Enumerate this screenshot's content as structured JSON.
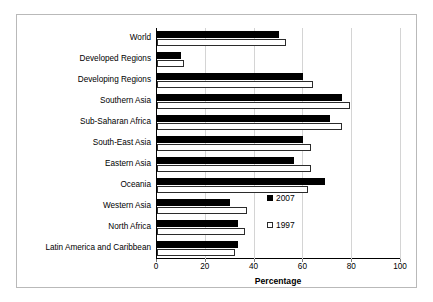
{
  "chart_data": {
    "type": "bar",
    "orientation": "horizontal",
    "title": "",
    "xlabel": "Percentage",
    "ylabel": "",
    "xlim": [
      0,
      100
    ],
    "xticks": [
      0,
      20,
      40,
      60,
      80,
      100
    ],
    "grid": "vertical",
    "legend_position": "inside-right",
    "categories": [
      "World",
      "Developed Regions",
      "Developing Regions",
      "Southern Asia",
      "Sub-Saharan Africa",
      "South-East Asia",
      "Eastern Asia",
      "Oceania",
      "Western Asia",
      "North Africa",
      "Latin America and Caribbean"
    ],
    "series": [
      {
        "name": "2007",
        "color": "#000000",
        "style": "filled",
        "values": [
          50,
          10,
          60,
          76,
          71,
          60,
          56,
          69,
          30,
          33,
          33
        ]
      },
      {
        "name": "1997",
        "color": "#ffffff",
        "style": "hollow",
        "values": [
          53,
          11,
          64,
          79,
          76,
          63,
          63,
          62,
          37,
          36,
          32
        ]
      }
    ]
  },
  "legend": {
    "entries": [
      {
        "label": "2007",
        "swatch": "filled-square-icon"
      },
      {
        "label": "1997",
        "swatch": "hollow-square-icon"
      }
    ]
  }
}
